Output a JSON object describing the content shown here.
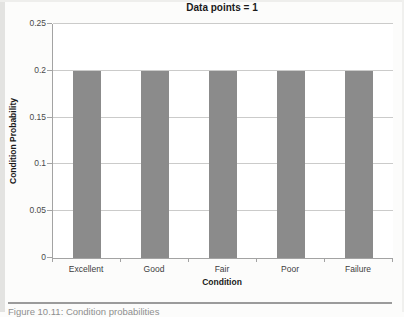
{
  "chart_data": {
    "type": "bar",
    "title": "Data points = 1",
    "categories": [
      "Excellent",
      "Good",
      "Fair",
      "Poor",
      "Failure"
    ],
    "values": [
      0.2,
      0.2,
      0.2,
      0.2,
      0.2
    ],
    "xlabel": "Condition",
    "ylabel": "Condition Probability",
    "ylim": [
      0,
      0.25
    ],
    "yticks": [
      0,
      0.05,
      0.1,
      0.15,
      0.2,
      0.25
    ],
    "grid": true,
    "legend": "none",
    "colors": {
      "bar": "#8b8b8b",
      "gridline": "#cbcbca",
      "axis": "#a3a3a3",
      "title_text": "#1a1a1a",
      "tick_text": "#4a4a4a"
    }
  },
  "caption": {
    "text": "Figure 10.11: Condition probabilities"
  }
}
